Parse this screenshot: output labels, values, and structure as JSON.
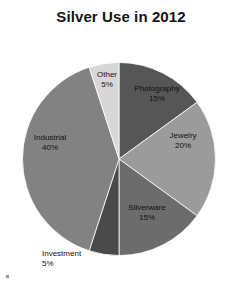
{
  "chart_data": {
    "type": "pie",
    "title": "Silver Use in 2012",
    "xlabel": "",
    "ylabel": "",
    "legend_position": "none",
    "grid": false,
    "labels_show_percent": true,
    "start_angle_deg": 0,
    "direction": "clockwise",
    "categories": [
      "Photography",
      "Jewelry",
      "Silverware",
      "Investment",
      "Industrial",
      "Other"
    ],
    "values": [
      15,
      20,
      15,
      5,
      40,
      5
    ],
    "slices": [
      {
        "name": "Photography",
        "value": 15,
        "percent_label": "15%",
        "color": "#565656"
      },
      {
        "name": "Jewelry",
        "value": 20,
        "percent_label": "20%",
        "color": "#9b9b9b"
      },
      {
        "name": "Silverware",
        "value": 15,
        "percent_label": "15%",
        "color": "#6c6c6c"
      },
      {
        "name": "Investment",
        "value": 5,
        "percent_label": "5%",
        "color": "#4a4a4a"
      },
      {
        "name": "Industrial",
        "value": 40,
        "percent_label": "40%",
        "color": "#828282"
      },
      {
        "name": "Other",
        "value": 5,
        "percent_label": "5%",
        "color": "#d7d7d7"
      }
    ]
  },
  "colors": {
    "background": "#ffffff",
    "title": "#141414",
    "label_text": "#111111",
    "leader_line": "#2b2b2b"
  }
}
